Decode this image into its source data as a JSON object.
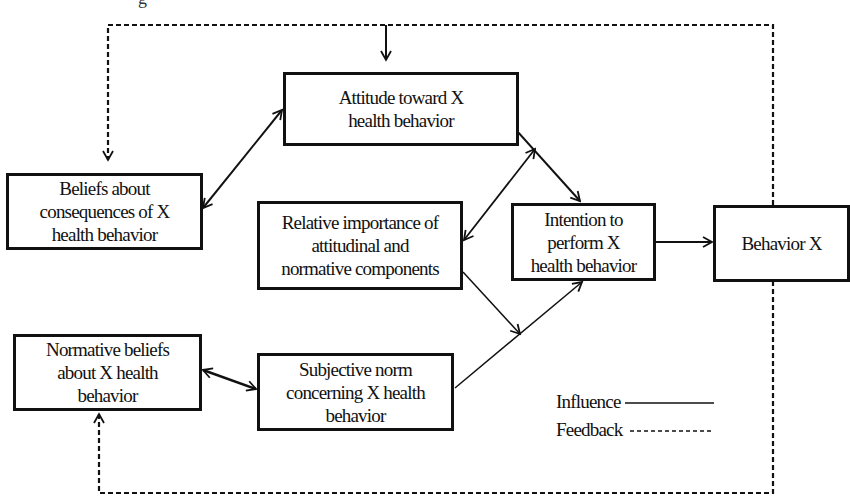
{
  "caption_fragment": "g",
  "nodes": {
    "attitude": {
      "label": "Attitude toward X health behavior",
      "lines": [
        "Attitude toward X",
        "health behavior"
      ]
    },
    "beliefs": {
      "label": "Beliefs about consequences of X health behavior",
      "lines": [
        "Beliefs about",
        "consequences of X",
        "health behavior"
      ]
    },
    "relative": {
      "label": "Relative importance of attitudinal and normative components",
      "lines": [
        "Relative importance of",
        "attitudinal and",
        "normative components"
      ]
    },
    "intention": {
      "label": "Intention to perform X health behavior",
      "lines": [
        "Intention to",
        "perform X",
        "health behavior"
      ]
    },
    "behavior": {
      "label": "Behavior X",
      "lines": [
        "Behavior X"
      ]
    },
    "normative": {
      "label": "Normative beliefs about X health behavior",
      "lines": [
        "Normative beliefs",
        "about X health",
        "behavior"
      ]
    },
    "subjective": {
      "label": "Subjective norm concerning X health behavior",
      "lines": [
        "Subjective norm",
        "concerning X health",
        "behavior"
      ]
    }
  },
  "edges": [
    {
      "from": "beliefs",
      "to": "attitude",
      "type": "influence",
      "bidirectional": true
    },
    {
      "from": "attitude",
      "to": "intention",
      "type": "influence",
      "bidirectional": true
    },
    {
      "from": "relative",
      "to": "attitude-intention-link",
      "type": "influence",
      "bidirectional": true
    },
    {
      "from": "relative",
      "to": "subjective-intention-link",
      "type": "influence"
    },
    {
      "from": "normative",
      "to": "subjective",
      "type": "influence",
      "bidirectional": true
    },
    {
      "from": "subjective",
      "to": "intention",
      "type": "influence"
    },
    {
      "from": "intention",
      "to": "behavior",
      "type": "influence"
    },
    {
      "from": "behavior",
      "to": "attitude",
      "type": "feedback"
    },
    {
      "from": "behavior",
      "to": "beliefs",
      "type": "feedback"
    },
    {
      "from": "behavior",
      "to": "normative",
      "type": "feedback"
    }
  ],
  "legend": {
    "influence_label": "Influence",
    "feedback_label": "Feedback"
  },
  "colors": {
    "line": "#111111",
    "background": "#ffffff"
  }
}
